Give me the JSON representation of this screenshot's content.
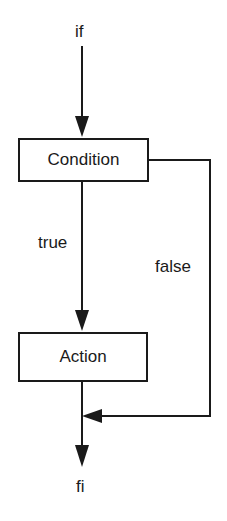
{
  "diagram": {
    "start_label": "if",
    "end_label": "fi",
    "condition_node": "Condition",
    "action_node": "Action",
    "true_edge_label": "true",
    "false_edge_label": "false"
  },
  "colors": {
    "stroke": "#1a1a1a",
    "background": "#ffffff"
  }
}
